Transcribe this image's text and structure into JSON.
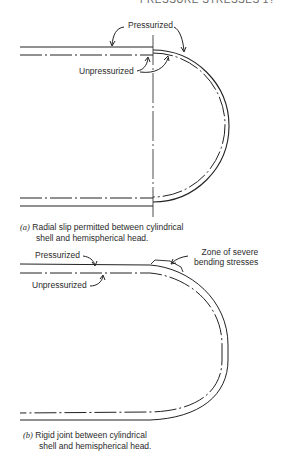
{
  "header": {
    "text": "PRESSURE STRESSES 1?"
  },
  "figure_a": {
    "labels": {
      "pressurized": "Pressurized",
      "unpressurized": "Unpressurized"
    },
    "caption": {
      "tag": "(a)",
      "line1": "Radial slip permitted between cylindrical",
      "line2": "shell and hemispherical head."
    }
  },
  "figure_b": {
    "labels": {
      "pressurized": "Pressurized",
      "unpressurized": "Unpressurized",
      "zone_line1": "Zone of severe",
      "zone_line2": "bending stresses"
    },
    "caption": {
      "tag": "(b)",
      "line1": "Rigid joint between cylindrical",
      "line2": "shell and hemispherical head."
    }
  }
}
